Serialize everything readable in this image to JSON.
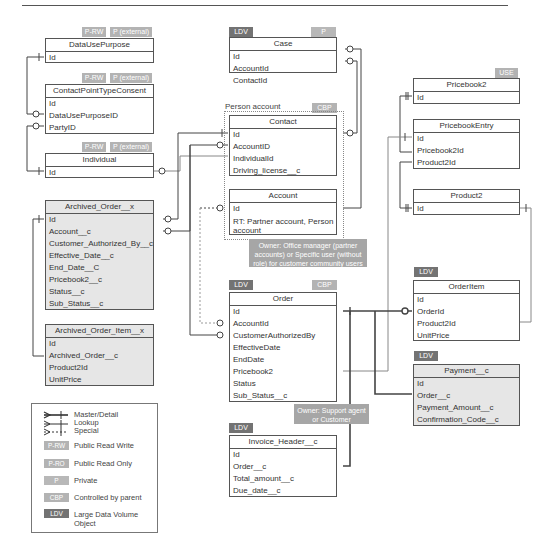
{
  "header": {
    "caption_fragment": "... g  y  p  ... g ..."
  },
  "entities": {
    "data_use_purpose": {
      "title": "DataUsePurpose",
      "fields": [
        "Id"
      ],
      "badges": [
        "P-RW",
        "P (external)"
      ]
    },
    "contact_point_type_consent": {
      "title": "ContactPointTypeConsent",
      "fields": [
        "Id",
        "DataUsePurposeID",
        "PartyID"
      ],
      "badges": [
        "P-RW",
        "P (external)"
      ]
    },
    "individual": {
      "title": "Individual",
      "fields": [
        "Id"
      ],
      "badges": [
        "P-RW",
        "P (external)"
      ]
    },
    "archived_order": {
      "title": "Archived_Order__x",
      "fields": [
        "Id",
        "Account__c",
        "Customer_Authorized_By__c",
        "Effective_Date__c",
        "End_Date__C",
        "Pricebook2__c",
        "Status__c",
        "Sub_Status__c"
      ]
    },
    "archived_order_item": {
      "title": "Archived_Order_Item__x",
      "fields": [
        "Id",
        "Archived_Order__c",
        "Product2Id",
        "UnitPrice"
      ]
    },
    "case": {
      "title": "Case",
      "fields": [
        "Id",
        "AccountId",
        "ContactId"
      ],
      "badges": [
        "LDV",
        "P"
      ]
    },
    "contact": {
      "title": "Contact",
      "fields": [
        "Id",
        "AccountID",
        "IndividualId",
        "Driving_license__c"
      ]
    },
    "account": {
      "title": "Account",
      "fields": [
        "Id",
        "RT: Partner account, Person account"
      ]
    },
    "order": {
      "title": "Order",
      "fields": [
        "Id",
        "AccountId",
        "CustomerAuthorizedBy",
        "EffectiveDate",
        "EndDate",
        "Pricebook2",
        "Status",
        "Sub_Status__c"
      ],
      "badges": [
        "LDV",
        "CBP"
      ]
    },
    "invoice_header": {
      "title": "Invoice_Header__c",
      "fields": [
        "Id",
        "Order__c",
        "Total_amount__c",
        "Due_date__c"
      ],
      "badges": [
        "LDV"
      ]
    },
    "pricebook2": {
      "title": "Pricebook2",
      "fields": [
        "Id"
      ],
      "badges": [
        "USE"
      ]
    },
    "pricebook_entry": {
      "title": "PricebookEntry",
      "fields": [
        "Id",
        "Pricebook2Id",
        "Product2Id"
      ]
    },
    "product2": {
      "title": "Product2",
      "fields": [
        "Id"
      ]
    },
    "order_item": {
      "title": "OrderItem",
      "fields": [
        "Id",
        "OrderId",
        "Product2Id",
        "UnitPrice"
      ],
      "badges": [
        "LDV"
      ]
    },
    "payment": {
      "title": "Payment__c",
      "fields": [
        "Id",
        "Order__c",
        "Payment_Amount__c",
        "Confirmation_Code__c"
      ],
      "badges": [
        "LDV"
      ]
    }
  },
  "groups": {
    "person_account": {
      "label": "Person account",
      "badge": "CBP"
    }
  },
  "notes": {
    "account_owner": "Owner: Office manager (partner accounts) or Specific user (without role) for customer community users",
    "order_owner": "Owner: Support agent or Customer"
  },
  "legend": {
    "relations": [
      "Master/Detail",
      "Lookup",
      "Special"
    ],
    "badges": [
      {
        "code": "P-RW",
        "label": "Public Read Write",
        "color": "#b3b3b3"
      },
      {
        "code": "P-RO",
        "label": "Public Read Only",
        "color": "#b3b3b3"
      },
      {
        "code": "P",
        "label": "Private",
        "color": "#b8b8b8"
      },
      {
        "code": "CBP",
        "label": "Controlled by parent",
        "color": "#b3b3b3"
      },
      {
        "code": "LDV",
        "label": "Large Data Volume Object",
        "color": "#737373"
      }
    ]
  }
}
